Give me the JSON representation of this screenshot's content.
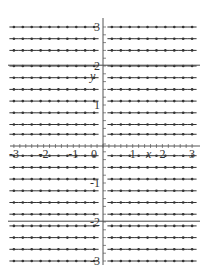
{
  "chart_data": {
    "type": "slope_field",
    "title": "",
    "xlabel": "x",
    "ylabel": "y",
    "xlim": [
      -3,
      3
    ],
    "ylim": [
      -3,
      3
    ],
    "grid": false,
    "x_ticks": [
      -3,
      -2,
      -1,
      0,
      1,
      2,
      3
    ],
    "y_ticks": [
      3,
      2,
      1,
      -1,
      -2,
      -3
    ],
    "x_tick_labels": [
      "-3",
      "-2",
      "-1",
      "0",
      "1",
      "2",
      "3"
    ],
    "y_tick_labels": [
      "3",
      "2",
      "1",
      "-1",
      "-2",
      "-3"
    ],
    "field_x_samples": [
      -3.0,
      -2.7,
      -2.4,
      -2.1,
      -1.8,
      -1.5,
      -1.2,
      -0.9,
      -0.6,
      -0.3,
      0.3,
      0.6,
      0.9,
      1.2,
      1.5,
      1.8,
      2.1,
      2.4,
      2.7,
      3.0
    ],
    "field_y_samples": [
      3.0,
      2.7,
      2.4,
      2.0,
      1.7,
      1.4,
      1.1,
      0.8,
      0.5,
      0.25,
      -0.3,
      -0.6,
      -0.9,
      -1.2,
      -1.5,
      -1.8,
      -2.1,
      -2.4,
      -2.7,
      -3.0
    ],
    "slope_all": 0,
    "solution_curves": [
      {
        "name": "equilibrium y=2",
        "y": 2
      },
      {
        "name": "equilibrium y=-2",
        "y": -2
      }
    ],
    "colors": {
      "field": "#333333",
      "axis": "#555555",
      "curve": "#444444"
    }
  },
  "axes": {
    "x_label": "x",
    "y_label": "y"
  }
}
